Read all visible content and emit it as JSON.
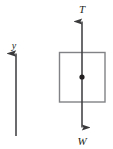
{
  "diagram": {
    "type": "free-body-diagram",
    "background_color": "#ffffff",
    "stroke_color": "#3a3a3c",
    "box_stroke_color": "#808285",
    "label_color": "#231f20",
    "axis": {
      "name": "y",
      "label": "y",
      "direction": "up",
      "x": 16,
      "y_top": 52,
      "y_bottom": 136,
      "label_x": 14,
      "label_y": 49
    },
    "body": {
      "name": "block",
      "shape": "rectangle",
      "x": 59,
      "y": 52,
      "width": 46,
      "height": 50,
      "fill": "none"
    },
    "point_of_application": {
      "name": "center-of-mass",
      "cx": 82,
      "cy": 77,
      "r": 2.6
    },
    "forces": [
      {
        "name": "tension",
        "label": "T",
        "direction": "up",
        "x": 82,
        "tail_y": 77,
        "head_y": 20,
        "label_x": 82,
        "label_y": 12
      },
      {
        "name": "weight",
        "label": "W",
        "direction": "down",
        "x": 82,
        "tail_y": 77,
        "head_y": 129,
        "label_x": 82,
        "label_y": 144
      }
    ]
  }
}
